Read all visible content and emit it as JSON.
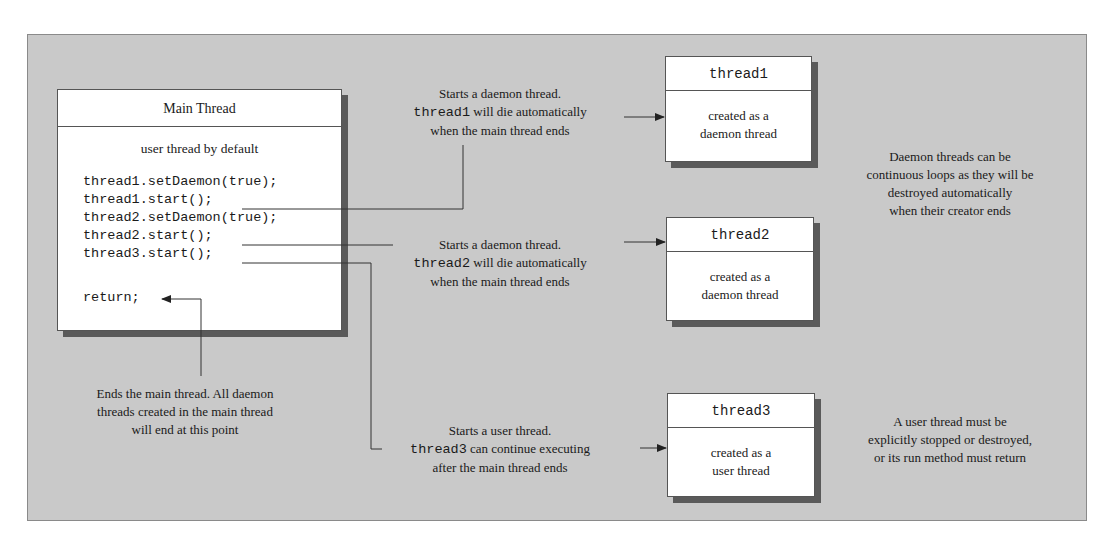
{
  "diagram": {
    "main_thread": {
      "title": "Main Thread",
      "subtitle": "user thread by default",
      "code_lines": [
        "thread1.setDaemon(true);",
        "thread1.start();",
        "thread2.setDaemon(true);",
        "thread2.start();",
        "thread3.start();",
        "",
        "return;"
      ]
    },
    "threads": [
      {
        "name": "thread1",
        "body_line1": "created as a",
        "body_line2": "daemon thread"
      },
      {
        "name": "thread2",
        "body_line1": "created as a",
        "body_line2": "daemon thread"
      },
      {
        "name": "thread3",
        "body_line1": "created as a",
        "body_line2": "user thread"
      }
    ],
    "annotations": {
      "thread1_start": {
        "line1": "Starts a daemon thread.",
        "code": "thread1",
        "line2_rest": " will die automatically",
        "line3": "when the main thread ends"
      },
      "thread2_start": {
        "line1": "Starts a daemon thread.",
        "code": "thread2",
        "line2_rest": " will die automatically",
        "line3": "when the main thread ends"
      },
      "thread3_start": {
        "line1": "Starts a user thread.",
        "code": "thread3",
        "line2_rest": " can continue executing",
        "line3": "after the main thread ends"
      },
      "return": {
        "line1": "Ends the main thread. All daemon",
        "line2": "threads created in the main thread",
        "line3": "will end at this point"
      },
      "daemon_note": {
        "line1": "Daemon threads can be",
        "line2": "continuous loops as they will be",
        "line3": "destroyed automatically",
        "line4": "when their creator ends"
      },
      "user_note": {
        "line1": "A user thread must be",
        "line2": "explicitly stopped or destroyed,",
        "line3": "or its run method must return"
      }
    },
    "colors": {
      "panel": "#c9c9c9",
      "box": "#ffffff",
      "shadow": "#5a5a5a",
      "line": "#333333"
    }
  }
}
